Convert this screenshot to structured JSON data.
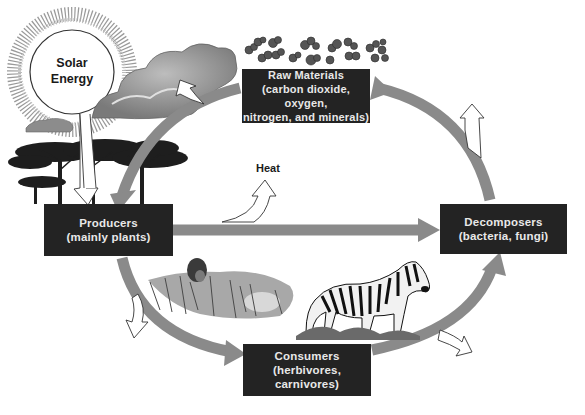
{
  "diagram": {
    "colors": {
      "box_fill": "#232323",
      "box_text": "#e8e8e8",
      "cycle_arrow": "#8a8a8a",
      "background": "#ffffff"
    },
    "sun": {
      "line1": "Solar",
      "line2": "Energy"
    },
    "heat_label": "Heat",
    "nodes": {
      "raw_materials": {
        "line1": "Raw Materials",
        "line2": "(carbon dioxide, oxygen,",
        "line3": "nitrogen, and minerals)"
      },
      "producers": {
        "line1": "Producers",
        "line2": "(mainly plants)"
      },
      "decomposers": {
        "line1": "Decomposers",
        "line2": "(bacteria, fungi)"
      },
      "consumers": {
        "line1": "Consumers",
        "line2": "(herbivores, carnivores)"
      }
    },
    "flows": [
      {
        "from": "Solar Energy",
        "to": "Producers",
        "type": "energy-input"
      },
      {
        "from": "Raw Materials",
        "to": "Producers",
        "type": "nutrient-cycle"
      },
      {
        "from": "Producers",
        "to": "Decomposers",
        "type": "nutrient-cycle"
      },
      {
        "from": "Producers",
        "to": "Consumers",
        "type": "nutrient-cycle"
      },
      {
        "from": "Consumers",
        "to": "Decomposers",
        "type": "nutrient-cycle"
      },
      {
        "from": "Decomposers",
        "to": "Raw Materials",
        "type": "nutrient-cycle"
      },
      {
        "from": "Producers",
        "to": "Heat",
        "type": "energy-loss"
      },
      {
        "from": "Consumers",
        "to": "Heat",
        "type": "energy-loss"
      },
      {
        "from": "Decomposers",
        "to": "Heat",
        "type": "energy-loss"
      }
    ],
    "illustrations": [
      "sun",
      "clouds",
      "molecules",
      "acacia-trees",
      "lions",
      "zebra",
      "grass"
    ]
  }
}
